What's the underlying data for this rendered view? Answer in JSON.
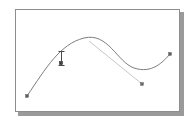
{
  "app": {
    "title": "Curve Editor Canvas",
    "background_color": "#ffffff"
  },
  "canvas": {
    "name": "drawing-canvas",
    "width": 165,
    "height": 103,
    "border_color": "#8d8d8d",
    "shadow_color": "#9a9a9a",
    "fill_color": "#ffffff"
  },
  "cursor": {
    "type": "i-beam-text-cursor",
    "x": 41,
    "y": 41,
    "color": "#4a4a4a"
  },
  "chart_data": {
    "type": "line",
    "title": "",
    "subtitle": "",
    "xlabel": "",
    "ylabel": "",
    "grid": false,
    "legend": "none",
    "xlim": [
      0,
      165
    ],
    "ylim": [
      0,
      103
    ],
    "stroke_color": "#7d7d7d",
    "handle_color": "#b9b9b9",
    "node_color": "#5c5c5c",
    "series": [
      {
        "name": "bezier-path",
        "type": "bezier",
        "path": "M 11 86 C 30 58 44 34 68 28 C 92 22 101 52 118 58 C 136 64 147 52 154 44",
        "points": [
          {
            "x": 11,
            "y": 86,
            "role": "endpoint-start",
            "shape": "square"
          },
          {
            "x": 68,
            "y": 28,
            "role": "peak",
            "shape": "none"
          },
          {
            "x": 118,
            "y": 58,
            "role": "valley",
            "shape": "none"
          },
          {
            "x": 154,
            "y": 44,
            "role": "endpoint-end",
            "shape": "square"
          }
        ]
      },
      {
        "name": "control-handle-line",
        "type": "straight",
        "from": {
          "x": 73,
          "y": 31
        },
        "to": {
          "x": 126,
          "y": 74
        },
        "color": "#b9b9b9"
      }
    ],
    "nodes": [
      {
        "x": 11,
        "y": 86,
        "label": "start-node",
        "selected": false
      },
      {
        "x": 45,
        "y": 53,
        "label": "selected-node",
        "selected": true
      },
      {
        "x": 126,
        "y": 74,
        "label": "control-handle-node",
        "selected": false
      },
      {
        "x": 154,
        "y": 44,
        "label": "end-node",
        "selected": false
      }
    ]
  }
}
